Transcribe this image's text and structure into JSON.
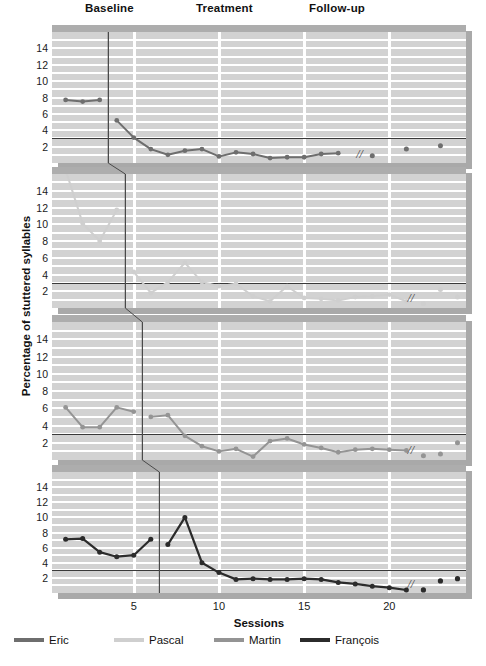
{
  "phases": {
    "baseline_label": "Baseline",
    "treatment_label": "Treatment",
    "followup_label": "Follow-up"
  },
  "axes": {
    "ylabel": "Percentage of stuttered syllables",
    "xlabel": "Sessions",
    "yticks": [
      14,
      12,
      10,
      8,
      6,
      4,
      2
    ],
    "xticks": [
      5,
      10,
      15,
      20
    ],
    "ylim": [
      0,
      16
    ],
    "xlim": [
      0.2,
      24.5
    ],
    "criterion_value": 3
  },
  "legend": [
    {
      "name": "Eric",
      "color": "#6e6e6e"
    },
    {
      "name": "Pascal",
      "color": "#cfcfcf"
    },
    {
      "name": "Martin",
      "color": "#949494"
    },
    {
      "name": "François",
      "color": "#2b2b2b"
    }
  ],
  "break_mark": "//",
  "chart_data": {
    "type": "line",
    "title": "Percentage of stuttered syllables",
    "xlabel": "Sessions",
    "ylabel": "Percentage of stuttered syllables",
    "xlim": [
      0.2,
      24.5
    ],
    "ylim": [
      0,
      16
    ],
    "grid": true,
    "legend_position": "bottom",
    "design": "multiple-baseline across participants",
    "criterion_line": 3,
    "panels": [
      {
        "participant": "Eric",
        "color": "#6e6e6e",
        "phase_change_session": 3.5,
        "baseline": {
          "x": [
            1,
            2,
            3
          ],
          "y": [
            7.7,
            7.5,
            7.7
          ]
        },
        "treatment": {
          "x": [
            4,
            5,
            6,
            7,
            8,
            9,
            10,
            11,
            12,
            13,
            14,
            15,
            16,
            17
          ],
          "y": [
            5.2,
            3.1,
            1.7,
            1.0,
            1.5,
            1.7,
            0.8,
            1.3,
            1.1,
            0.6,
            0.7,
            0.7,
            1.1,
            1.2
          ]
        },
        "followup": {
          "x": [
            19,
            21,
            23
          ],
          "y": [
            0.9,
            1.7,
            2.1
          ]
        }
      },
      {
        "participant": "Pascal",
        "color": "#cfcfcf",
        "phase_change_session": 4.5,
        "baseline": {
          "x": [
            1,
            2,
            3,
            4
          ],
          "y": [
            16.5,
            10.1,
            8.0,
            11.7
          ]
        },
        "treatment": {
          "x": [
            5,
            6,
            7,
            8,
            9,
            10,
            11,
            12,
            13,
            14,
            15,
            16,
            17,
            18,
            19,
            20,
            21
          ],
          "y": [
            4.3,
            1.8,
            3.1,
            5.4,
            3.1,
            2.6,
            2.9,
            1.4,
            0.8,
            2.6,
            1.2,
            1.1,
            0.9,
            1.3,
            1.4,
            1.6,
            0.8
          ]
        },
        "followup": {
          "x": [
            22,
            23,
            24
          ],
          "y": [
            0.5,
            2.2,
            1.3
          ]
        }
      },
      {
        "participant": "Martin",
        "color": "#949494",
        "phase_change_session": 5.5,
        "baseline": {
          "x": [
            1,
            2,
            3,
            4,
            5
          ],
          "y": [
            6.1,
            3.8,
            3.8,
            6.1,
            5.6
          ]
        },
        "treatment": {
          "x": [
            6,
            7,
            8,
            9,
            10,
            11,
            12,
            13,
            14,
            15,
            16,
            17,
            18,
            19,
            20,
            21
          ],
          "y": [
            5.0,
            5.2,
            2.8,
            1.6,
            1.0,
            1.3,
            0.4,
            2.2,
            2.5,
            1.8,
            1.4,
            0.9,
            1.2,
            1.3,
            1.2
          ],
          "y_extra": [
            1.1
          ]
        },
        "followup": {
          "x": [
            22,
            23,
            24
          ],
          "y": [
            0.5,
            0.7,
            2.0
          ]
        }
      },
      {
        "participant": "François",
        "color": "#2b2b2b",
        "phase_change_session": 6.5,
        "baseline": {
          "x": [
            1,
            2,
            3,
            4,
            5,
            6
          ],
          "y": [
            7.1,
            7.2,
            5.4,
            4.8,
            5.0,
            7.1
          ]
        },
        "treatment": {
          "x": [
            7,
            8,
            9,
            10,
            11,
            12,
            13,
            14,
            15,
            16,
            17,
            18,
            19,
            20,
            21
          ],
          "y": [
            6.4,
            10.0,
            4.0,
            2.7,
            1.8,
            1.9,
            1.8,
            1.8,
            1.9,
            1.8,
            1.4,
            1.2,
            0.9,
            0.7,
            0.4
          ]
        },
        "followup": {
          "x": [
            22,
            23,
            24
          ],
          "y": [
            0.4,
            1.6,
            1.9
          ]
        }
      }
    ]
  }
}
